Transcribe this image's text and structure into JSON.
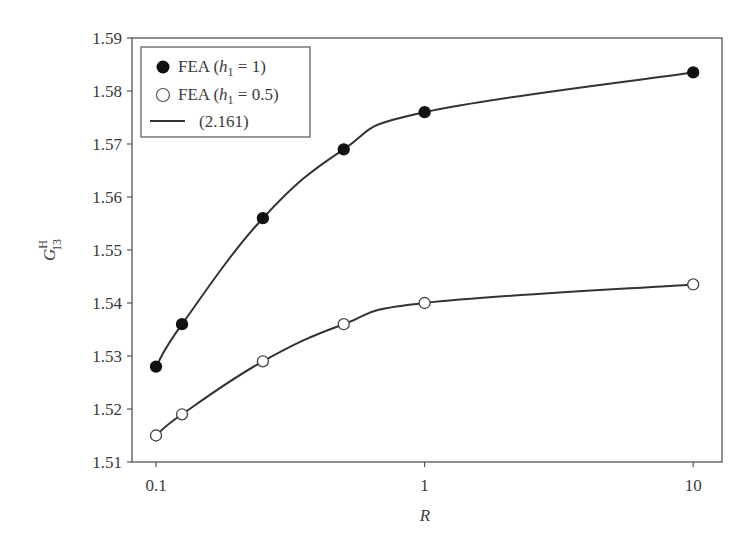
{
  "chart_data": {
    "type": "line",
    "title": "",
    "xlabel": "R",
    "ylabel": "G_13^H",
    "ylabel_main": "G",
    "ylabel_sup": "H",
    "ylabel_sub": "13",
    "xscale": "log",
    "xlim": [
      0.0814,
      12.8
    ],
    "ylim": [
      1.51,
      1.59
    ],
    "x_ticks": [
      0.1,
      1,
      10
    ],
    "x_tick_labels": [
      "0.1",
      "1",
      "10"
    ],
    "y_ticks": [
      1.51,
      1.52,
      1.53,
      1.54,
      1.55,
      1.56,
      1.57,
      1.58,
      1.59
    ],
    "y_tick_labels": [
      "1.51",
      "1.52",
      "1.53",
      "1.54",
      "1.55",
      "1.56",
      "1.57",
      "1.58",
      "1.59"
    ],
    "grid": false,
    "legend_position": "upper left",
    "series": [
      {
        "name": "FEA (h1 = 1)",
        "legend_label_prefix": "FEA (",
        "legend_label_var": "h",
        "legend_label_sub": "1",
        "legend_label_suffix": " = 1)",
        "marker": "filled-circle",
        "x": [
          0.1,
          0.125,
          0.25,
          0.5,
          1,
          10
        ],
        "values": [
          1.528,
          1.536,
          1.556,
          1.569,
          1.576,
          1.5835
        ]
      },
      {
        "name": "FEA (h1 = 0.5)",
        "legend_label_prefix": "FEA (",
        "legend_label_var": "h",
        "legend_label_sub": "1",
        "legend_label_suffix": " = 0.5)",
        "marker": "open-circle",
        "x": [
          0.1,
          0.125,
          0.25,
          0.5,
          1,
          10
        ],
        "values": [
          1.515,
          1.519,
          1.529,
          1.536,
          1.54,
          1.5435
        ]
      },
      {
        "name": "(2.161)",
        "marker": "line",
        "legend_label": "(2.161)"
      }
    ],
    "colors": {
      "axis": "#555555",
      "line": "#333333",
      "marker_fill": "#111111",
      "marker_open_fill": "#ffffff"
    }
  }
}
